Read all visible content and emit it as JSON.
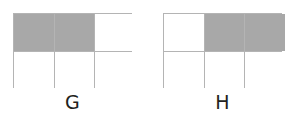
{
  "figure": {
    "background_color": "#ffffff",
    "shaded_color": "#a8a8a8",
    "unshaded_color": "#ffffff",
    "border_color": "#b4b4b4",
    "label_color": "#231f20",
    "groups": [
      {
        "label": "G",
        "rows": 2,
        "columns": 3,
        "total_cells": 6,
        "shaded_count": 2,
        "fraction": "2/6",
        "cells": [
          {
            "row": 1,
            "col": 1,
            "shaded": true
          },
          {
            "row": 1,
            "col": 2,
            "shaded": true
          },
          {
            "row": 1,
            "col": 3,
            "shaded": false
          },
          {
            "row": 2,
            "col": 1,
            "shaded": false
          },
          {
            "row": 2,
            "col": 2,
            "shaded": false
          },
          {
            "row": 2,
            "col": 3,
            "shaded": false
          }
        ]
      },
      {
        "label": "H",
        "rows": 2,
        "columns": 3,
        "total_cells": 6,
        "shaded_count": 2,
        "fraction": "2/6",
        "cells": [
          {
            "row": 1,
            "col": 1,
            "shaded": false
          },
          {
            "row": 1,
            "col": 2,
            "shaded": true
          },
          {
            "row": 1,
            "col": 3,
            "shaded": true
          },
          {
            "row": 2,
            "col": 1,
            "shaded": false
          },
          {
            "row": 2,
            "col": 2,
            "shaded": false
          },
          {
            "row": 2,
            "col": 3,
            "shaded": false
          }
        ]
      }
    ]
  },
  "chart_data": {
    "type": "table",
    "title": "",
    "xlabel": "",
    "ylabel": "",
    "categories": [
      "G",
      "H"
    ],
    "values": [
      2,
      2
    ],
    "series": [
      {
        "name": "shaded cells",
        "values": [
          2,
          2
        ]
      },
      {
        "name": "total cells",
        "values": [
          6,
          6
        ]
      }
    ],
    "annotations": [
      "G: 2 of 6 rectangles shaded (top-left, top-middle)",
      "H: 2 of 6 rectangles shaded (top-middle, top-right)"
    ],
    "grid": true,
    "legend_position": "none"
  }
}
